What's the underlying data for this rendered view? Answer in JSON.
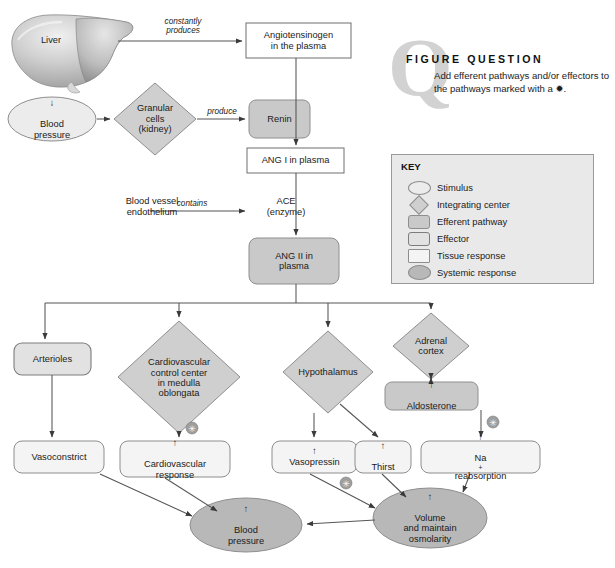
{
  "figure_question": {
    "q_letter": "Q",
    "title": "FIGURE QUESTION",
    "body": "Add efferent pathways and/or effectors to the pathways marked with a ✹."
  },
  "key": {
    "title": "KEY",
    "items": [
      {
        "shape": "oval-light",
        "label": "Stimulus"
      },
      {
        "shape": "diamond",
        "label": "Integrating center"
      },
      {
        "shape": "rounded-dark",
        "label": "Efferent pathway"
      },
      {
        "shape": "rounded-mid",
        "label": "Effector"
      },
      {
        "shape": "square-light",
        "label": "Tissue response"
      },
      {
        "shape": "oval-dark",
        "label": "Systemic response"
      }
    ]
  },
  "nodes": {
    "liver": {
      "label": "Liver",
      "type": "illustration"
    },
    "angiotensinogen": {
      "line1": "Angiotensinogen",
      "line2": "in the plasma",
      "type": "tissue-response"
    },
    "blood_pressure_low": {
      "arrow": "↓",
      "line1": "Blood",
      "line2": "pressure",
      "type": "stimulus"
    },
    "granular_cells": {
      "line1": "Granular",
      "line2": "cells",
      "line3": "(kidney)",
      "type": "integrating-center"
    },
    "renin": {
      "label": "Renin",
      "type": "efferent-pathway"
    },
    "ang_i": {
      "label": "ANG I in plasma",
      "type": "tissue-response"
    },
    "blood_vessel_endothelium": {
      "line1": "Blood vessel",
      "line2": "endothelium",
      "type": "plain-text"
    },
    "ace": {
      "line1": "ACE",
      "line2": "(enzyme)",
      "type": "plain-text"
    },
    "ang_ii": {
      "line1": "ANG II in",
      "line2": "plasma",
      "type": "efferent-pathway"
    },
    "arterioles": {
      "label": "Arterioles",
      "type": "effector"
    },
    "cv_control_center": {
      "line1": "Cardiovascular",
      "line2": "control center",
      "line3": "in medulla",
      "line4": "oblongata",
      "type": "integrating-center"
    },
    "hypothalamus": {
      "label": "Hypothalamus",
      "type": "integrating-center"
    },
    "adrenal_cortex": {
      "line1": "Adrenal",
      "line2": "cortex",
      "type": "integrating-center"
    },
    "aldosterone": {
      "arrow": "↑",
      "label": "Aldosterone",
      "type": "efferent-pathway"
    },
    "vasoconstrict": {
      "label": "Vasoconstrict",
      "type": "tissue-response"
    },
    "cv_response": {
      "arrow": "↑",
      "line1": "Cardiovascular",
      "line2": "response",
      "type": "tissue-response"
    },
    "vasopressin": {
      "arrow": "↑",
      "label": "Vasopressin",
      "type": "tissue-response"
    },
    "thirst": {
      "arrow": "↑",
      "label": "Thirst",
      "type": "tissue-response"
    },
    "na_reabsorption": {
      "arrow": "↑",
      "label_pre": "Na",
      "label_sup": "+",
      "label_post": " reabsorption",
      "type": "tissue-response"
    },
    "blood_pressure_up": {
      "arrow": "↑",
      "line1": "Blood",
      "line2": "pressure",
      "type": "systemic-response"
    },
    "volume_osmolarity": {
      "arrow": "↑",
      "line1": "Volume",
      "line2": "and maintain",
      "line3": "osmolarity",
      "type": "systemic-response"
    }
  },
  "edge_labels": {
    "constantly_produces": {
      "line1": "constantly",
      "line2": "produces"
    },
    "produce": "produce",
    "contains": "contains"
  },
  "markers": {
    "star_marker_symbol": "✹",
    "count": 3,
    "on_edges": [
      "cv-control-center-to-cv-response",
      "aldosterone-to-na-reabsorption",
      "vasopressin-to-volume"
    ]
  },
  "colors": {
    "stimulus_fill": "#ececec",
    "integrating_center_fill": "#cfcfcf",
    "efferent_pathway_fill": "#c9c9c9",
    "effector_fill": "#e2e2e2",
    "tissue_response_fill": "#f4f4f4",
    "systemic_response_fill": "#b8b8b8",
    "stroke": "#8e8e8e",
    "line": "#555555",
    "key_background": "#e9e9e9",
    "q_watermark": "#d2d2d2"
  }
}
